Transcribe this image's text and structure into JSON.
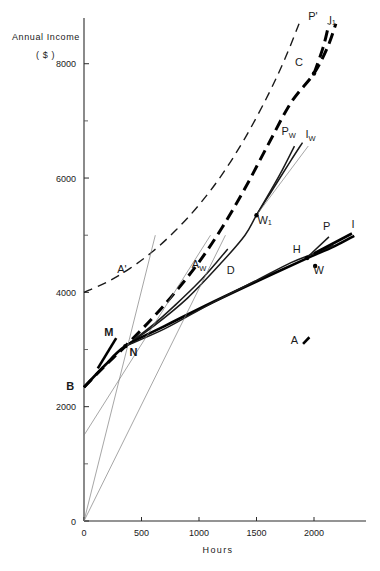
{
  "figure": {
    "y_axis_title_line1": "Annual  Income",
    "y_axis_title_line2": "( $ )",
    "x_axis_title": "Hours"
  },
  "chart_data": {
    "type": "line",
    "title": "",
    "xlabel": "Hours",
    "ylabel": "Annual Income ($)",
    "xlim": [
      0,
      2400
    ],
    "ylim": [
      0,
      8800
    ],
    "grid": false,
    "legend": "none",
    "xticks": [
      0,
      500,
      1000,
      1500,
      2000
    ],
    "xtick_labels": [
      "0",
      "500",
      "1000",
      "1500",
      "2000"
    ],
    "yticks": [
      0,
      2000,
      4000,
      6000,
      8000
    ],
    "ytick_labels": [
      "0",
      "2000",
      "4000",
      "6000",
      "8000"
    ],
    "yticks_minor": [
      1000,
      3000,
      5000,
      7000
    ],
    "series": [
      {
        "name": "A'",
        "style": "dashed-thin",
        "label": "A'",
        "label_x": 330,
        "label_y": 4340,
        "points": [
          [
            0,
            4000
          ],
          [
            200,
            4180
          ],
          [
            400,
            4420
          ],
          [
            600,
            4720
          ],
          [
            800,
            5090
          ],
          [
            1000,
            5530
          ],
          [
            1200,
            6060
          ],
          [
            1400,
            6700
          ],
          [
            1600,
            7450
          ],
          [
            1750,
            8100
          ],
          [
            1870,
            8700
          ]
        ]
      },
      {
        "name": "I1",
        "style": "dashed-thick",
        "label": "I₁",
        "label_x": 2150,
        "label_y": 8760,
        "points": [
          [
            0,
            2340
          ],
          [
            180,
            2710
          ],
          [
            360,
            3060
          ],
          [
            600,
            3560
          ],
          [
            800,
            4020
          ],
          [
            1000,
            4530
          ],
          [
            1200,
            5130
          ],
          [
            1400,
            5820
          ],
          [
            1600,
            6580
          ],
          [
            1800,
            7320
          ],
          [
            2000,
            7830
          ],
          [
            2120,
            8300
          ],
          [
            2190,
            8700
          ]
        ]
      },
      {
        "name": "P'",
        "style": "dashed-thick",
        "label": "P'",
        "label_x": 2010,
        "label_y": 8780,
        "points": [
          [
            2000,
            7830
          ],
          [
            2080,
            8290
          ],
          [
            2130,
            8700
          ]
        ]
      },
      {
        "name": "Aw",
        "style": "medium",
        "label": "A_W",
        "label_x": 1030,
        "label_y": 4370,
        "points": [
          [
            360,
            3060
          ],
          [
            600,
            3430
          ],
          [
            800,
            3790
          ],
          [
            1000,
            4180
          ],
          [
            1150,
            4520
          ],
          [
            1250,
            4760
          ]
        ]
      },
      {
        "name": "Iw-curve",
        "style": "medium",
        "label": "W₁",
        "label_x": 1570,
        "label_y": 5280,
        "points": [
          [
            360,
            3060
          ],
          [
            600,
            3400
          ],
          [
            900,
            3900
          ],
          [
            1200,
            4530
          ],
          [
            1400,
            5000
          ],
          [
            1500,
            5350
          ],
          [
            1650,
            5830
          ],
          [
            1800,
            6310
          ],
          [
            1900,
            6620
          ]
        ]
      },
      {
        "name": "Pw",
        "style": "medium",
        "label": "P_W",
        "label_x": 1800,
        "label_y": 6750,
        "points": [
          [
            1500,
            5350
          ],
          [
            1700,
            6050
          ],
          [
            1830,
            6560
          ]
        ]
      },
      {
        "name": "Iw-ray",
        "style": "thin",
        "label": "I_W",
        "label_x": 1960,
        "label_y": 6700,
        "points": [
          [
            1500,
            5350
          ],
          [
            1950,
            6560
          ]
        ]
      },
      {
        "name": "A",
        "style": "thick",
        "label": "A",
        "label_x": 1870,
        "label_y": 3110,
        "points": [
          [
            0,
            2340
          ],
          [
            180,
            2720
          ],
          [
            360,
            3060
          ],
          [
            700,
            3410
          ],
          [
            1100,
            3810
          ],
          [
            1500,
            4190
          ],
          [
            1900,
            4560
          ],
          [
            2180,
            4810
          ],
          [
            2350,
            4990
          ]
        ]
      },
      {
        "name": "W-curve",
        "style": "medium",
        "label": "W",
        "label_x": 1980,
        "label_y": 4170,
        "points": [
          [
            360,
            3060
          ],
          [
            700,
            3360
          ],
          [
            1100,
            3800
          ],
          [
            1500,
            4210
          ],
          [
            1800,
            4520
          ],
          [
            2000,
            4680
          ],
          [
            2170,
            4820
          ]
        ]
      },
      {
        "name": "P",
        "style": "medium",
        "label": "P",
        "label_x": 2120,
        "label_y": 5080,
        "points": [
          [
            1960,
            4650
          ],
          [
            2130,
            4970
          ]
        ]
      },
      {
        "name": "I",
        "style": "thick",
        "label": "I",
        "label_x": 2350,
        "label_y": 5110,
        "points": [
          [
            2000,
            4680
          ],
          [
            2330,
            5030
          ]
        ]
      },
      {
        "name": "ray-steep",
        "style": "thin",
        "points": [
          [
            0,
            0
          ],
          [
            620,
            5000
          ]
        ]
      },
      {
        "name": "ray-shallow",
        "style": "thin",
        "points": [
          [
            0,
            0
          ],
          [
            1230,
            5000
          ]
        ]
      },
      {
        "name": "ray-offset",
        "style": "thin",
        "points": [
          [
            0,
            1500
          ],
          [
            1100,
            5000
          ]
        ]
      },
      {
        "name": "M-tick",
        "style": "thick",
        "label": "M",
        "label_x": 215,
        "label_y": 3230,
        "points": [
          [
            120,
            2670
          ],
          [
            280,
            3200
          ]
        ]
      }
    ],
    "points": [
      {
        "label": "B",
        "x": 0,
        "y": 2340,
        "label_x": -120,
        "label_y": 2290,
        "bold": true,
        "marker": false
      },
      {
        "label": "N",
        "x": 360,
        "y": 3060,
        "label_x": 430,
        "label_y": 2890,
        "bold": true,
        "marker": true
      },
      {
        "label": "M",
        "x": 215,
        "y": 3230,
        "label_x": 215,
        "label_y": 3230,
        "bold": true,
        "marker": false
      },
      {
        "label": "D",
        "x": 1190,
        "y": 4420,
        "label_x": 1275,
        "label_y": 4330,
        "bold": false,
        "marker": false
      },
      {
        "label": "C",
        "x": 2000,
        "y": 7830,
        "label_x": 1870,
        "label_y": 7960,
        "bold": false,
        "marker": true
      },
      {
        "label": "W₁",
        "x": 1500,
        "y": 5350,
        "label_x": 1570,
        "label_y": 5200,
        "bold": false,
        "marker": true
      },
      {
        "label": "H",
        "x": 1940,
        "y": 4600,
        "label_x": 1850,
        "label_y": 4680,
        "bold": false,
        "marker": true
      },
      {
        "label": "W",
        "x": 2010,
        "y": 4460,
        "label_x": 2040,
        "label_y": 4330,
        "bold": false,
        "marker": true
      }
    ],
    "annotations": [
      {
        "text": "A'",
        "x": 330,
        "y": 4340
      },
      {
        "text": "A_W",
        "x": 1000,
        "y": 4420
      },
      {
        "text": "A",
        "x": 1830,
        "y": 3100
      },
      {
        "text": "I₁",
        "x": 2160,
        "y": 8700
      },
      {
        "text": "P'",
        "x": 1990,
        "y": 8760
      },
      {
        "text": "P_W",
        "x": 1780,
        "y": 6760
      },
      {
        "text": "I_W",
        "x": 1970,
        "y": 6700
      },
      {
        "text": "P",
        "x": 2110,
        "y": 5090
      },
      {
        "text": "I",
        "x": 2340,
        "y": 5120
      }
    ]
  }
}
